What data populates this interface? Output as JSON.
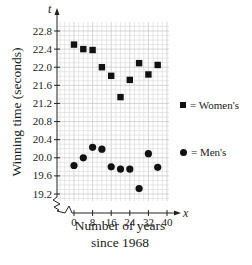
{
  "chart_data": {
    "type": "scatter",
    "title": "",
    "xlabel": "Number of years since 1968",
    "ylabel": "Winning time (seconds)",
    "x_axis_var": "x",
    "y_axis_var": "t",
    "xlim": [
      0,
      40
    ],
    "ylim": [
      19.2,
      22.8
    ],
    "y_axis_break": true,
    "grid": true,
    "legend_position": "right",
    "x_ticks": [
      0,
      8,
      16,
      24,
      32,
      40
    ],
    "y_ticks": [
      19.2,
      19.6,
      20.0,
      20.4,
      20.8,
      21.2,
      21.6,
      22.0,
      22.4,
      22.8
    ],
    "series": [
      {
        "name": "Women's",
        "marker": "square",
        "x": [
          0,
          4,
          8,
          12,
          16,
          20,
          24,
          28,
          32,
          36
        ],
        "y": [
          22.5,
          22.4,
          22.38,
          22.0,
          21.81,
          21.34,
          21.72,
          22.09,
          21.84,
          22.05
        ]
      },
      {
        "name": "Men's",
        "marker": "circle",
        "x": [
          0,
          4,
          8,
          12,
          16,
          20,
          24,
          28,
          32,
          36
        ],
        "y": [
          19.83,
          20.0,
          20.23,
          20.19,
          19.8,
          19.75,
          19.75,
          19.32,
          20.09,
          19.79
        ]
      }
    ]
  },
  "labels": {
    "ylabel": "Winning time (seconds)",
    "xlabel_line1": "Number of years",
    "xlabel_line2": "since 1968",
    "x_var": "x",
    "y_var": "t"
  },
  "legend": {
    "women_label": "= Women's",
    "men_label": "= Men's"
  }
}
